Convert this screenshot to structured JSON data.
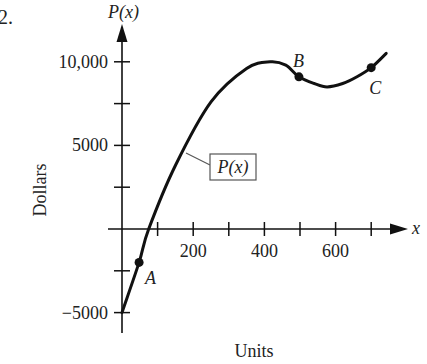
{
  "problem_number": "2.",
  "chart_data": {
    "type": "line",
    "title": "",
    "xlabel": "Units",
    "ylabel": "Dollars",
    "x_axis_var": "x",
    "y_axis_var": "P(x)",
    "curve_label": "P(x)",
    "xlim": [
      0,
      750
    ],
    "ylim": [
      -6000,
      13000
    ],
    "x_ticks": [
      100,
      200,
      300,
      400,
      500,
      600,
      700
    ],
    "x_tick_labels": [
      "200",
      "400",
      "600"
    ],
    "x_tick_label_values": [
      200,
      400,
      600
    ],
    "y_ticks": [
      -5000,
      -2500,
      2500,
      5000,
      7500,
      10000
    ],
    "y_tick_labels": [
      "10,000",
      "5000",
      "−5000"
    ],
    "y_tick_label_values": [
      10000,
      5000,
      -5000
    ],
    "grid": false,
    "series": [
      {
        "name": "P(x)",
        "x": [
          0,
          48,
          75,
          150,
          250,
          350,
          416,
          460,
          497,
          540,
          576,
          620,
          660,
          700,
          742
        ],
        "y": [
          -5000,
          -2000,
          0,
          3800,
          7600,
          9600,
          10000,
          9800,
          9100,
          8700,
          8500,
          8700,
          9100,
          9650,
          10500
        ]
      }
    ],
    "points": [
      {
        "label": "A",
        "x": 48,
        "y": -2000
      },
      {
        "label": "B",
        "x": 497,
        "y": 9100
      },
      {
        "label": "C",
        "x": 700,
        "y": 9650
      }
    ]
  }
}
